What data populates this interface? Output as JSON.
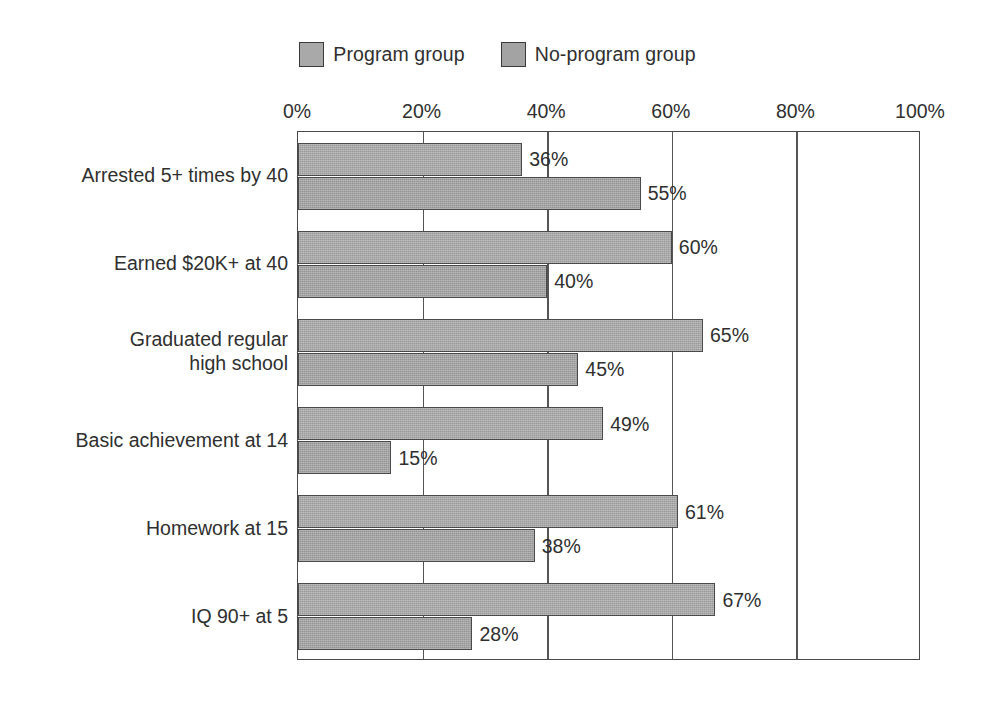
{
  "chart_data": {
    "type": "bar",
    "orientation": "horizontal",
    "title": "",
    "subtitle": "",
    "xlabel": "",
    "ylabel": "",
    "xlim": [
      0,
      100
    ],
    "xticks": [
      "0%",
      "20%",
      "40%",
      "60%",
      "80%",
      "100%"
    ],
    "xtick_values": [
      0,
      20,
      40,
      60,
      80,
      100
    ],
    "grid": true,
    "legend_position": "top-center",
    "value_label_suffix": "%",
    "categories": [
      "Arrested 5+ times by 40",
      "Earned $20K+ at 40",
      "Graduated regular\nhigh school",
      "Basic achievement at 14",
      "Homework at 15",
      "IQ 90+ at 5"
    ],
    "series": [
      {
        "name": "Program group",
        "color": "#a9a9a9",
        "values": [
          36,
          60,
          65,
          49,
          61,
          67
        ],
        "value_labels": [
          "36%",
          "60%",
          "65%",
          "49%",
          "61%",
          "67%"
        ]
      },
      {
        "name": "No-program group",
        "color": "#a3a3a3",
        "values": [
          55,
          40,
          45,
          15,
          38,
          28
        ],
        "value_labels": [
          "55%",
          "40%",
          "45%",
          "15%",
          "38%",
          "28%"
        ]
      }
    ]
  },
  "legend": {
    "items": [
      {
        "label": "Program group",
        "color": "#a9a9a9"
      },
      {
        "label": "No-program group",
        "color": "#a3a3a3"
      }
    ]
  },
  "colors": {
    "bar_fill_program": "#a9a9a9",
    "bar_fill_no_program": "#a3a3a3",
    "bar_outline": "#4a4a4a",
    "axis": "#4a4a4a",
    "gridline": "#555555",
    "text": "#2f2f2f",
    "background": "#ffffff"
  }
}
